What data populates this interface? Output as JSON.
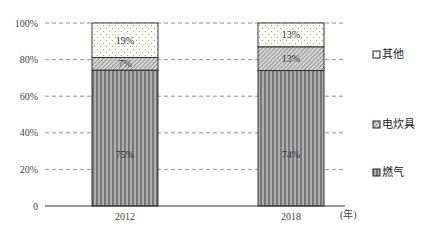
{
  "chart_data": {
    "type": "bar",
    "stacked": true,
    "percent": true,
    "title": "",
    "xlabel": "(年)",
    "ylabel": "",
    "ylim": [
      0,
      100
    ],
    "yticks": [
      "0",
      "20%",
      "40%",
      "60%",
      "80%",
      "100%"
    ],
    "grid": "dashed horizontal",
    "legend_position": "right",
    "categories": [
      "2012",
      "2018"
    ],
    "series": [
      {
        "name": "燃气",
        "values": [
          75,
          74
        ],
        "labels": [
          "75%",
          "74%"
        ],
        "pattern": "vertical-stripes"
      },
      {
        "name": "电炊具",
        "values": [
          7,
          13
        ],
        "labels": [
          "7%",
          "13%"
        ],
        "pattern": "diagonal-hatch"
      },
      {
        "name": "其他",
        "values": [
          19,
          13
        ],
        "labels": [
          "19%",
          "13%"
        ],
        "pattern": "dots"
      }
    ],
    "legend": [
      "其他",
      "电炊具",
      "燃气"
    ]
  }
}
